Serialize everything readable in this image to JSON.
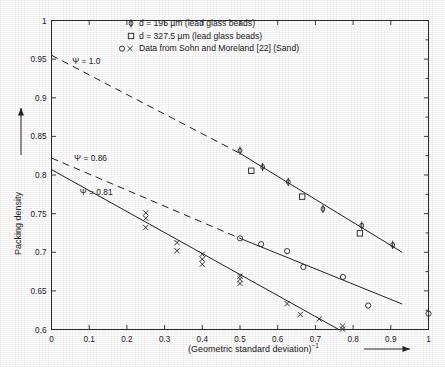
{
  "chart_data": {
    "type": "scatter",
    "title": "",
    "xlabel": "(Geometric standard deviation)⁻¹",
    "ylabel": "Packing density",
    "xlim": [
      0,
      1
    ],
    "ylim": [
      0.6,
      1
    ],
    "grid": false,
    "xticks": [
      "0",
      "0.1",
      "0.2",
      "0.3",
      "0.4",
      "0.5",
      "0.6",
      "0.7",
      "0.8",
      "0.9",
      "1"
    ],
    "xtick_values": [
      0,
      0.1,
      0.2,
      0.3,
      0.4,
      0.5,
      0.6,
      0.7,
      0.8,
      0.9,
      1
    ],
    "yticks": [
      "0.6",
      "0.65",
      "0.7",
      "0.75",
      "0.8",
      "0.85",
      "0.9",
      "0.95",
      "1"
    ],
    "ytick_values": [
      0.6,
      0.65,
      0.7,
      0.75,
      0.8,
      0.85,
      0.9,
      0.95,
      1
    ],
    "legend_position": "top-center",
    "legend": [
      {
        "marker": "phi",
        "label": "d = 195 µm  (lead glass beads)"
      },
      {
        "marker": "square",
        "label": "d = 327.5 µm  (lead glass beads)"
      },
      {
        "marker": "circle-and-cross",
        "label": "Data from Sohn and Moreland [22]  (Sand)"
      }
    ],
    "annotations": [
      {
        "text": "Ψ = 1.0",
        "x": 0.055,
        "y": 0.944
      },
      {
        "text": "Ψ = 0.86",
        "x": 0.06,
        "y": 0.818
      },
      {
        "text": "Ψ = 0.81",
        "x": 0.075,
        "y": 0.774
      }
    ],
    "fit_lines": [
      {
        "name": "Ψ = 1.0",
        "style": "dashed",
        "x": [
          0,
          0.5
        ],
        "y": [
          0.955,
          0.828
        ]
      },
      {
        "name": "Ψ = 1.0 extension",
        "style": "solid",
        "x": [
          0.5,
          0.93
        ],
        "y": [
          0.828,
          0.7
        ]
      },
      {
        "name": "Ψ = 0.86",
        "style": "dashed",
        "x": [
          0,
          0.5
        ],
        "y": [
          0.822,
          0.718
        ]
      },
      {
        "name": "Ψ = 0.86 extension",
        "style": "solid",
        "x": [
          0.5,
          0.93
        ],
        "y": [
          0.718,
          0.633
        ]
      },
      {
        "name": "Ψ = 0.81",
        "style": "solid",
        "x": [
          0,
          0.762
        ],
        "y": [
          0.807,
          0.6
        ]
      }
    ],
    "series": [
      {
        "name": "d = 195 µm (lead glass beads)",
        "marker": "phi",
        "points": [
          {
            "x": 0.5,
            "y": 0.8315
          },
          {
            "x": 0.56,
            "y": 0.8105
          },
          {
            "x": 0.628,
            "y": 0.791
          },
          {
            "x": 0.72,
            "y": 0.756
          },
          {
            "x": 0.823,
            "y": 0.7345
          },
          {
            "x": 0.905,
            "y": 0.7095
          }
        ]
      },
      {
        "name": "d = 327.5 µm (lead glass beads)",
        "marker": "square",
        "points": [
          {
            "x": 0.53,
            "y": 0.8055
          },
          {
            "x": 0.665,
            "y": 0.772
          },
          {
            "x": 0.818,
            "y": 0.7245
          }
        ]
      },
      {
        "name": "Sohn and Moreland [22] (Sand) - circles",
        "marker": "circle",
        "points": [
          {
            "x": 0.5,
            "y": 0.718
          },
          {
            "x": 0.556,
            "y": 0.7105
          },
          {
            "x": 0.625,
            "y": 0.7015
          },
          {
            "x": 0.668,
            "y": 0.681
          },
          {
            "x": 0.773,
            "y": 0.668
          },
          {
            "x": 0.84,
            "y": 0.631
          },
          {
            "x": 1.0,
            "y": 0.6205
          }
        ]
      },
      {
        "name": "Sohn and Moreland [22] (Sand) - crosses",
        "marker": "cross",
        "points": [
          {
            "x": 0.25,
            "y": 0.751
          },
          {
            "x": 0.25,
            "y": 0.744
          },
          {
            "x": 0.25,
            "y": 0.732
          },
          {
            "x": 0.333,
            "y": 0.7125
          },
          {
            "x": 0.333,
            "y": 0.702
          },
          {
            "x": 0.4,
            "y": 0.6975
          },
          {
            "x": 0.4,
            "y": 0.691
          },
          {
            "x": 0.4,
            "y": 0.6845
          },
          {
            "x": 0.5,
            "y": 0.669
          },
          {
            "x": 0.5,
            "y": 0.665
          },
          {
            "x": 0.5,
            "y": 0.6595
          },
          {
            "x": 0.625,
            "y": 0.6335
          },
          {
            "x": 0.66,
            "y": 0.6195
          },
          {
            "x": 0.71,
            "y": 0.6135
          },
          {
            "x": 0.772,
            "y": 0.6045
          },
          {
            "x": 0.772,
            "y": 0.6005
          }
        ]
      }
    ]
  }
}
